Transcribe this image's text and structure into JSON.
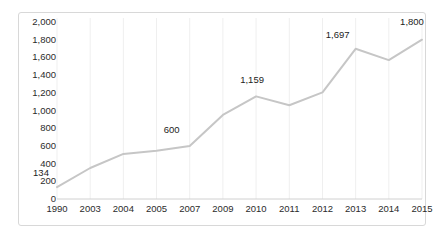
{
  "chart_data": {
    "type": "line",
    "title": "",
    "subtitle": "",
    "xlabel": "",
    "ylabel": "",
    "categories": [
      "1990",
      "2003",
      "2004",
      "2005",
      "2007",
      "2009",
      "2010",
      "2011",
      "2012",
      "2013",
      "2014",
      "2015"
    ],
    "series": [
      {
        "name": "",
        "values": [
          134,
          350,
          510,
          545,
          600,
          950,
          1159,
          1060,
          1205,
          1697,
          1570,
          1800
        ],
        "color": "#c6c6c6"
      }
    ],
    "ylim": [
      0,
      2000
    ],
    "yticks": [
      0,
      200,
      400,
      600,
      800,
      1000,
      1200,
      1400,
      1600,
      1800,
      2000
    ],
    "ytick_labels": [
      "0",
      "200",
      "400",
      "600",
      "800",
      "1,000",
      "1,200",
      "1,400",
      "1,600",
      "1,800",
      "2,000"
    ],
    "grid": "vertical-faint",
    "legend": "none",
    "data_labels": [
      {
        "category": "1990",
        "value": 134,
        "text": "134",
        "dx": -16,
        "dy": -14
      },
      {
        "category": "2007",
        "value": 600,
        "text": "600",
        "dx": -18,
        "dy": -16
      },
      {
        "category": "2010",
        "value": 1159,
        "text": "1,159",
        "dx": -4,
        "dy": -16
      },
      {
        "category": "2013",
        "value": 1697,
        "text": "1,697",
        "dx": -18,
        "dy": -14
      },
      {
        "category": "2015",
        "value": 1800,
        "text": "1,800",
        "dx": -10,
        "dy": -18
      }
    ],
    "colors": {
      "line": "#c6c6c6",
      "axis": "#d0d0d0",
      "grid": "#efefef",
      "text": "#2b2b2b",
      "frame": "#d8d8d8",
      "background": "#ffffff"
    }
  }
}
